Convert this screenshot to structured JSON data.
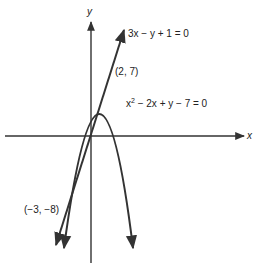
{
  "axes": {
    "x_label": "x",
    "y_label": "y"
  },
  "curves": {
    "line": {
      "equation": "3x − y + 1 = 0"
    },
    "parabola": {
      "equation_prefix": "x",
      "equation_exp": "2",
      "equation_rest": " − 2x + y − 7 = 0"
    }
  },
  "points": {
    "upper": "(2, 7)",
    "lower": "(−3, −8)"
  },
  "colors": {
    "stroke": "#333333",
    "background": "#ffffff"
  }
}
